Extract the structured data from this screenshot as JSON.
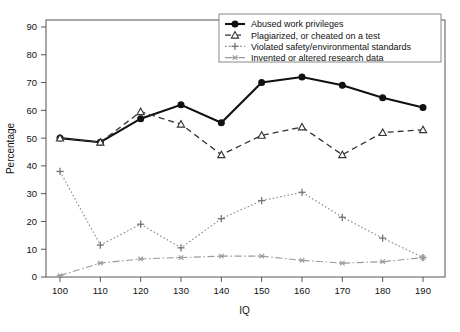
{
  "chart_data": {
    "type": "line",
    "title": "",
    "xlabel": "IQ",
    "ylabel": "Percentage",
    "x": [
      100,
      110,
      120,
      130,
      140,
      150,
      160,
      170,
      180,
      190
    ],
    "xtick_labels": [
      "100",
      "110",
      "120",
      "130",
      "140",
      "150",
      "160",
      "170",
      "180",
      "190"
    ],
    "ytick_labels": [
      "0",
      "10",
      "20",
      "30",
      "40",
      "50",
      "60",
      "70",
      "80",
      "90"
    ],
    "ytick_values": [
      0,
      10,
      20,
      30,
      40,
      50,
      60,
      70,
      80,
      90
    ],
    "xlim": [
      95,
      195
    ],
    "ylim": [
      0,
      93
    ],
    "grid": false,
    "legend_position": "top-right",
    "series": [
      {
        "name": "Abused work privileges",
        "marker": "filled-circle",
        "line_style": "solid",
        "color": "#111111",
        "values": [
          50,
          48.5,
          57,
          62,
          55.5,
          70,
          72,
          69,
          64.5,
          61
        ]
      },
      {
        "name": "Plagiarized, or cheated on a test",
        "marker": "open-triangle",
        "line_style": "dashed",
        "color": "#333333",
        "values": [
          50,
          48.5,
          59.5,
          55,
          44,
          51,
          54,
          44,
          52,
          53
        ]
      },
      {
        "name": "Violated safety/environmental standards",
        "marker": "plus",
        "line_style": "dotted",
        "color": "#888888",
        "values": [
          38,
          11.5,
          19,
          10.5,
          21,
          27.5,
          30.5,
          21.5,
          14,
          7
        ]
      },
      {
        "name": "Invented or altered research data",
        "marker": "asterisk",
        "line_style": "dash-dot",
        "color": "#9a9a9a",
        "values": [
          0.5,
          5,
          6.5,
          7,
          7.5,
          7.5,
          6,
          5,
          5.5,
          7
        ]
      }
    ]
  }
}
